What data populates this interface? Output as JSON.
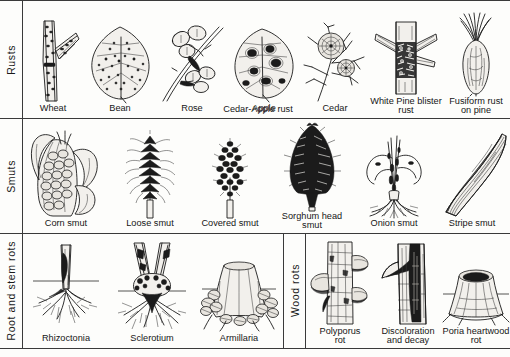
{
  "figure": {
    "background_color": "#fdfdfb",
    "ink_color": "#1b1b1b"
  },
  "sections": [
    {
      "id": "rusts",
      "label": "Rusts",
      "items": [
        {
          "name": "wheat",
          "caption": "Wheat",
          "icon": "wheat-stem-rust-icon"
        },
        {
          "name": "bean",
          "caption": "Bean",
          "icon": "bean-leaf-rust-icon"
        },
        {
          "name": "rose",
          "caption": "Rose",
          "icon": "rose-cane-rust-icon"
        },
        {
          "name": "apple",
          "caption": "Apple",
          "icon": "apple-leaf-rust-icon"
        },
        {
          "name": "cedar",
          "caption": "Cedar",
          "icon": "cedar-gall-rust-icon"
        },
        {
          "name": "white-pine-blister-rust",
          "caption": "White Pine blister\nrust",
          "icon": "pine-blister-canker-icon"
        },
        {
          "name": "fusiform-rust-on-pine",
          "caption": "Fusiform rust\non pine",
          "icon": "fusiform-gall-icon"
        }
      ],
      "spanning_caption": "Cedar-Apple rust"
    },
    {
      "id": "smuts",
      "label": "Smuts",
      "items": [
        {
          "name": "corn-smut",
          "caption": "Corn smut",
          "icon": "corn-ear-smut-icon"
        },
        {
          "name": "loose-smut",
          "caption": "Loose smut",
          "icon": "loose-smut-head-icon"
        },
        {
          "name": "covered-smut",
          "caption": "Covered smut",
          "icon": "covered-smut-head-icon"
        },
        {
          "name": "sorghum-head-smut",
          "caption": "Sorghum head\nsmut",
          "icon": "sorghum-head-smut-icon"
        },
        {
          "name": "onion-smut",
          "caption": "Onion smut",
          "icon": "onion-seedling-smut-icon"
        },
        {
          "name": "stripe-smut",
          "caption": "Stripe smut",
          "icon": "striped-leaf-smut-icon"
        }
      ],
      "spanning_caption": ""
    },
    {
      "id": "root-and-stem-rots",
      "label": "Root and stem rots",
      "items": [
        {
          "name": "rhizoctonia",
          "caption": "Rhizoctonia",
          "icon": "rhizoctonia-stem-lesion-icon"
        },
        {
          "name": "sclerotium",
          "caption": "Sclerotium",
          "icon": "sclerotium-crown-rot-icon"
        },
        {
          "name": "armillaria",
          "caption": "Armillaria",
          "icon": "armillaria-stump-icon"
        }
      ],
      "spanning_caption": ""
    },
    {
      "id": "wood-rots",
      "label": "Wood rots",
      "items": [
        {
          "name": "polyporus-rot",
          "caption": "Polyporus\nrot",
          "icon": "polyporus-conk-trunk-icon"
        },
        {
          "name": "discoloration-and-decay",
          "caption": "Discoloration\nand decay",
          "icon": "trunk-discoloration-icon"
        },
        {
          "name": "poria-heartwood-rot",
          "caption": "Poria heartwood\nrot",
          "icon": "hollow-stump-icon"
        }
      ],
      "spanning_caption": ""
    }
  ]
}
